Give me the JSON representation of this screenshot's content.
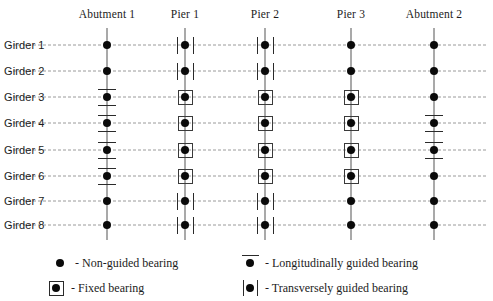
{
  "diagram": {
    "columns": [
      {
        "id": "abutment-1",
        "label": "Abutment 1",
        "x": 107
      },
      {
        "id": "pier-1",
        "label": "Pier 1",
        "x": 185
      },
      {
        "id": "pier-2",
        "label": "Pier 2",
        "x": 265
      },
      {
        "id": "pier-3",
        "label": "Pier 3",
        "x": 351
      },
      {
        "id": "abutment-2",
        "label": "Abutment 2",
        "x": 434
      }
    ],
    "rows": [
      {
        "id": "girder-1",
        "label": "Girder 1",
        "y": 45
      },
      {
        "id": "girder-2",
        "label": "Girder 2",
        "y": 71
      },
      {
        "id": "girder-3",
        "label": "Girder 3",
        "y": 97
      },
      {
        "id": "girder-4",
        "label": "Girder 4",
        "y": 123
      },
      {
        "id": "girder-5",
        "label": "Girder 5",
        "y": 150
      },
      {
        "id": "girder-6",
        "label": "Girder 6",
        "y": 176
      },
      {
        "id": "girder-7",
        "label": "Girder 7",
        "y": 201
      },
      {
        "id": "girder-8",
        "label": "Girder 8",
        "y": 225
      }
    ],
    "support_line_extent": {
      "top": 28,
      "bottom": 240
    },
    "bearing_matrix": [
      {
        "column": "abutment-1",
        "bearings": [
          "non-guided",
          "non-guided",
          "longitudinal",
          "longitudinal",
          "longitudinal",
          "longitudinal",
          "non-guided",
          "non-guided"
        ]
      },
      {
        "column": "pier-1",
        "bearings": [
          "transverse",
          "transverse",
          "fixed",
          "fixed",
          "fixed",
          "fixed",
          "transverse",
          "transverse"
        ]
      },
      {
        "column": "pier-2",
        "bearings": [
          "transverse",
          "transverse",
          "fixed",
          "fixed",
          "fixed",
          "fixed",
          "transverse",
          "transverse"
        ]
      },
      {
        "column": "pier-3",
        "bearings": [
          "non-guided",
          "non-guided",
          "fixed",
          "fixed",
          "fixed",
          "fixed",
          "non-guided",
          "non-guided"
        ]
      },
      {
        "column": "abutment-2",
        "bearings": [
          "non-guided",
          "non-guided",
          "non-guided",
          "longitudinal",
          "longitudinal",
          "non-guided",
          "non-guided",
          "non-guided"
        ]
      }
    ]
  },
  "legend": {
    "items": [
      {
        "id": "non-guided",
        "symbol": "non-guided",
        "text": "- Non-guided bearing",
        "x": 48,
        "y": 4
      },
      {
        "id": "fixed",
        "symbol": "fixed",
        "text": "- Fixed bearing",
        "x": 44,
        "y": 29
      },
      {
        "id": "longitudinal",
        "symbol": "longitudinal",
        "text": "- Longitudinally guided bearing",
        "x": 238,
        "y": 4
      },
      {
        "id": "transverse",
        "symbol": "transverse",
        "text": "- Transversely guided bearing",
        "x": 238,
        "y": 29
      }
    ]
  },
  "colors": {
    "dot": "#0a0a0a",
    "support_line": "#555555",
    "girder_line": "#9a9a9a",
    "symbol_stroke": "#2a2a2a",
    "background": "#ffffff",
    "text": "#1c1c1c"
  }
}
